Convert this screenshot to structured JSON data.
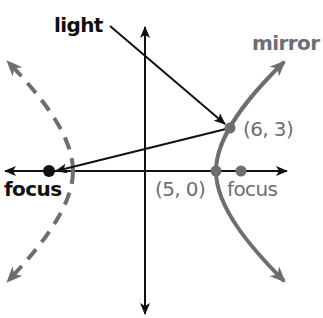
{
  "diagram": {
    "colors": {
      "axes": "#111111",
      "mirror": "#6d6e71",
      "light": "#111111",
      "dashed_branch": "#6d6e71"
    },
    "labels": {
      "light": "light",
      "mirror": "mirror",
      "point_reflect": "(6, 3)",
      "vertex": "(5, 0)",
      "focus_right": "focus",
      "focus_left": "focus"
    },
    "points": [
      {
        "name": "reflection-point",
        "x": 6,
        "y": 3
      },
      {
        "name": "vertex",
        "x": 5,
        "y": 0
      },
      {
        "name": "focus-right",
        "x": 6.74,
        "y": 0
      },
      {
        "name": "focus-left",
        "x": -6.74,
        "y": 0
      }
    ],
    "curve": {
      "type": "hyperbola",
      "a": 5,
      "b_squared": 20.45,
      "center": [
        0,
        0
      ]
    }
  }
}
